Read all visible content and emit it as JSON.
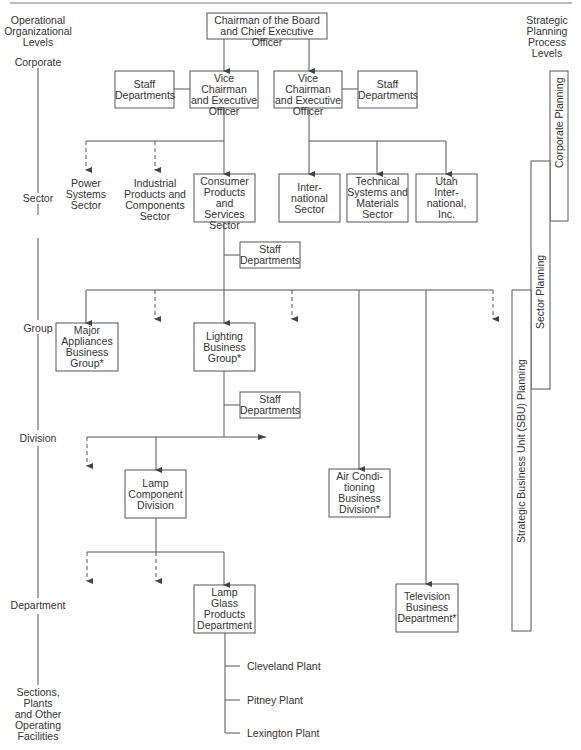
{
  "levels_header": {
    "operational": [
      "Operational",
      "Organizational",
      "Levels"
    ],
    "strategic": [
      "Strategic",
      "Planning",
      "Process",
      "Levels"
    ]
  },
  "operational_levels": [
    "Corporate",
    "Sector",
    "Group",
    "Division",
    "Department",
    [
      "Sections,",
      "Plants",
      "and Other",
      "Operating",
      "Facilities"
    ]
  ],
  "planning_bars": {
    "corporate": "Corporate Planning",
    "sector": "Sector Planning",
    "sbu": "Strategic Business Unit (SBU) Planning"
  },
  "nodes": {
    "chairman": [
      "Chairman of the Board",
      "and Chief Executive Officer"
    ],
    "vice_left": [
      "Vice Chairman",
      "and Executive",
      "Officer"
    ],
    "vice_right": [
      "Vice Chairman",
      "and Executive",
      "Officer"
    ],
    "staff_left": [
      "Staff",
      "Departments"
    ],
    "staff_right": [
      "Staff",
      "Departments"
    ],
    "power": [
      "Power",
      "Systems",
      "Sector"
    ],
    "industrial": [
      "Industrial",
      "Products and",
      "Components",
      "Sector"
    ],
    "consumer": [
      "Consumer",
      "Products and",
      "Services",
      "Sector"
    ],
    "international": [
      "Inter-",
      "national",
      "Sector"
    ],
    "technical": [
      "Technical",
      "Systems and",
      "Materials",
      "Sector"
    ],
    "utah": [
      "Utah",
      "Inter-",
      "national,",
      "Inc."
    ],
    "staff_sector": [
      "Staff",
      "Departments"
    ],
    "major_appliances": [
      "Major",
      "Appliances",
      "Business",
      "Group*"
    ],
    "lighting": [
      "Lighting",
      "Business",
      "Group*"
    ],
    "staff_group": [
      "Staff",
      "Departments"
    ],
    "lamp_component": [
      "Lamp",
      "Component",
      "Division"
    ],
    "air_conditioning": [
      "Air Condi-",
      "tioning",
      "Business",
      "Division*"
    ],
    "lamp_glass": [
      "Lamp",
      "Glass",
      "Products",
      "Department"
    ],
    "television": [
      "Television",
      "Business",
      "Department*"
    ]
  },
  "plants": [
    "Cleveland Plant",
    "Pitney Plant",
    "Lexington Plant"
  ]
}
